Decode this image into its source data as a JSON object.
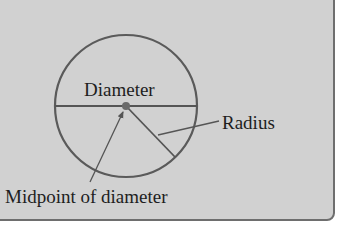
{
  "figure": {
    "labels": {
      "diameter": "Diameter",
      "radius": "Radius",
      "midpoint": "Midpoint of diameter"
    },
    "colors": {
      "background": "#d1d1d1",
      "stroke": "#555555",
      "text": "#1e1e1e",
      "border": "#6e6e6e"
    },
    "circle": {
      "center": [
        126,
        106
      ],
      "radius": 71
    },
    "elements": [
      {
        "type": "circle",
        "name": "circle"
      },
      {
        "type": "line",
        "name": "diameter",
        "from": [
          55,
          106
        ],
        "to": [
          197,
          106
        ]
      },
      {
        "type": "line",
        "name": "radius",
        "from": [
          126,
          106
        ],
        "to": [
          175,
          157
        ]
      },
      {
        "type": "point",
        "name": "midpoint",
        "at": [
          126,
          106
        ]
      },
      {
        "type": "arrow",
        "name": "midpoint-pointer",
        "from": [
          90,
          182
        ],
        "to": [
          123,
          112
        ]
      },
      {
        "type": "leader",
        "name": "radius-leader",
        "from": [
          158,
          135
        ],
        "to": [
          219,
          121
        ]
      }
    ]
  }
}
